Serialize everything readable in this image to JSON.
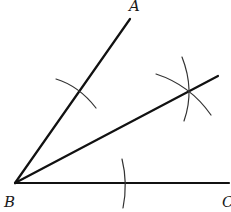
{
  "diagram": {
    "type": "angle-bisector-construction",
    "points": {
      "A": {
        "label": "A",
        "x": 130,
        "y": 19
      },
      "B": {
        "label": "B",
        "x": 15,
        "y": 183
      },
      "C": {
        "label": "C",
        "x": 229,
        "y": 183
      },
      "D": {
        "x": 218,
        "y": 76
      }
    },
    "labels": {
      "A": "A",
      "B": "B",
      "C": "C"
    },
    "stroke_color": "#111111",
    "background": "#ffffff"
  }
}
